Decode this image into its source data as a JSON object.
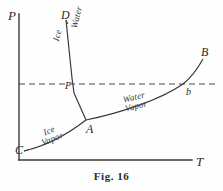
{
  "figure": {
    "caption": "Fig. 16",
    "caption_y": 170
  },
  "axes": {
    "y_label": "P",
    "x_label": "T",
    "origin": [
      19,
      160
    ],
    "y_top": [
      19,
      14
    ],
    "x_right": [
      192,
      160
    ],
    "color": "#3a3a3a"
  },
  "points": [
    {
      "id": "D",
      "label": "D",
      "x": 63,
      "y": 12,
      "desc": "upper end of fusion curve"
    },
    {
      "id": "F",
      "label": "F",
      "x": 70,
      "y": 86,
      "desc": "fusion curve at reference pressure"
    },
    {
      "id": "A",
      "label": "A",
      "x": 89,
      "y": 126,
      "desc": "triple point"
    },
    {
      "id": "C",
      "label": "C",
      "x": 20,
      "y": 150,
      "desc": "lower end of sublimation curve"
    },
    {
      "id": "b",
      "label": "b",
      "x": 190,
      "y": 92,
      "desc": "vaporization curve at reference pressure"
    },
    {
      "id": "B",
      "label": "B",
      "x": 204,
      "y": 51,
      "desc": "upper end of vaporization curve"
    }
  ],
  "region_labels": [
    {
      "id": "ice",
      "text": "Ice",
      "x": 57,
      "y": 44,
      "rotate": -76
    },
    {
      "id": "water",
      "text": "Water",
      "x": 70,
      "y": 32,
      "rotate": -76
    },
    {
      "id": "ice-vapor",
      "line1": "Ice",
      "line2": "Vapor",
      "x": 38,
      "y": 135,
      "rotate": -22
    },
    {
      "id": "water-vapor",
      "line1": "Water",
      "line2": "Vapor",
      "x": 124,
      "y": 100,
      "rotate": -14
    }
  ],
  "curves": {
    "fusion": {
      "name": "ice-water fusion curve (D-F-A)",
      "path": "M 66,20 L 72,78 L 74,93 L 86,120"
    },
    "sublimation": {
      "name": "ice-vapor sublimation curve (C-A)",
      "path": "M 24,151 C 45,146 68,134 86,120"
    },
    "vaporization": {
      "name": "water-vapor vaporization curve (A-b-B)",
      "path": "M 86,120 C 120,113 160,100 183,84 C 192,77 198,68 203,59"
    }
  },
  "reference_line": {
    "name": "atmospheric pressure dashed line",
    "y": 84,
    "x_start": 19,
    "x_end": 216,
    "dash": "6 4"
  },
  "colors": {
    "ink": "#3a3a3a",
    "ink_dark": "#2b2b2b",
    "background": "#fefefe"
  }
}
